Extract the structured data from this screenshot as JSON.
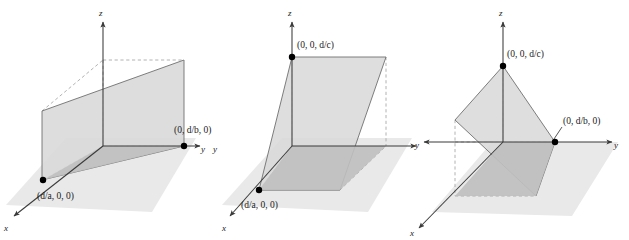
{
  "figure": {
    "panel_count": 3,
    "colors": {
      "ground_plane_fill": "#e9e9e9",
      "plane_light_fill": "#d8d8d8",
      "plane_dark_fill": "#bfbfbf",
      "edge_stroke": "#6b6b6b",
      "axis_stroke": "#3a3a3a",
      "dashed_stroke": "#a0a0a0",
      "dot_fill": "#000000",
      "text": "#1a1a1a",
      "background": "#ffffff"
    }
  },
  "panels": [
    {
      "id": "panel-1",
      "name": "plane-parallel-to-x-axis",
      "axes": {
        "x": "x",
        "y": "y",
        "z": "z"
      },
      "intercept_labels": [
        {
          "name": "x-intercept-label",
          "text": "(d/a, 0, 0)"
        },
        {
          "name": "y-intercept-label",
          "text": "(0, d/b, 0)"
        }
      ]
    },
    {
      "id": "panel-2",
      "name": "plane-parallel-to-y-axis",
      "axes": {
        "x": "x",
        "y": "y",
        "z": "z"
      },
      "intercept_labels": [
        {
          "name": "z-intercept-label",
          "text": "(0, 0, d/c)"
        },
        {
          "name": "x-intercept-label",
          "text": "(d/a, 0, 0)"
        }
      ]
    },
    {
      "id": "panel-3",
      "name": "plane-parallel-to-x-axis-tilted",
      "axes": {
        "x": "x",
        "y": "y",
        "z": "z"
      },
      "intercept_labels": [
        {
          "name": "z-intercept-label",
          "text": "(0, 0, d/c)"
        },
        {
          "name": "y-intercept-label",
          "text": "(0, d/b, 0)"
        }
      ]
    }
  ],
  "caption": ""
}
